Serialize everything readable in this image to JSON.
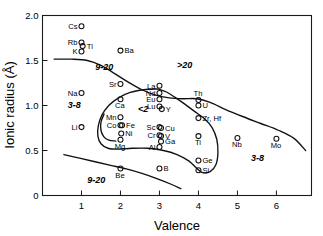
{
  "chart_data": {
    "type": "scatter",
    "title": "",
    "xlabel": "Valence",
    "ylabel": "Ionic radius (Å)",
    "xlim": [
      0,
      6.9
    ],
    "ylim": [
      0,
      2.0
    ],
    "xticks": [
      "1",
      "2",
      "3",
      "4",
      "5",
      "6"
    ],
    "xtick_values": [
      1,
      2,
      3,
      4,
      5,
      6
    ],
    "yticks": [
      "0",
      "0.5",
      "1.0",
      "1.5",
      "2.0"
    ],
    "ytick_values": [
      0,
      0.5,
      1.0,
      1.5,
      2.0
    ],
    "grid": false,
    "legend": "none",
    "points": [
      {
        "label": "Cs",
        "x": 1,
        "y": 1.88,
        "label_pos": "left"
      },
      {
        "label": "Rb",
        "x": 1,
        "y": 1.7,
        "label_pos": "left"
      },
      {
        "label": "Tl",
        "x": 1.03,
        "y": 1.66,
        "label_pos": "right"
      },
      {
        "label": "K",
        "x": 1,
        "y": 1.6,
        "label_pos": "left"
      },
      {
        "label": "Ba",
        "x": 2,
        "y": 1.61,
        "label_pos": "right"
      },
      {
        "label": "Sr",
        "x": 2,
        "y": 1.24,
        "label_pos": "left"
      },
      {
        "label": "La",
        "x": 3,
        "y": 1.22,
        "label_pos": "left"
      },
      {
        "label": "Na",
        "x": 1,
        "y": 1.14,
        "label_pos": "left"
      },
      {
        "label": "Nd",
        "x": 3,
        "y": 1.14,
        "label_pos": "left"
      },
      {
        "label": "Ca",
        "x": 2,
        "y": 1.07,
        "label_pos": "below"
      },
      {
        "label": "Eu",
        "x": 3,
        "y": 1.07,
        "label_pos": "left"
      },
      {
        "label": "Th",
        "x": 4,
        "y": 1.06,
        "label_pos": "above"
      },
      {
        "label": "U",
        "x": 4,
        "y": 1.0,
        "label_pos": "right"
      },
      {
        "label": "Lu",
        "x": 3,
        "y": 0.99,
        "label_pos": "left"
      },
      {
        "label": "Y",
        "x": 3.06,
        "y": 0.96,
        "label_pos": "right"
      },
      {
        "label": "Mn",
        "x": 2,
        "y": 0.87,
        "label_pos": "left"
      },
      {
        "label": "Zr, Hf",
        "x": 4,
        "y": 0.86,
        "label_pos": "right"
      },
      {
        "label": "Co",
        "x": 2,
        "y": 0.78,
        "label_pos": "left"
      },
      {
        "label": "Fe",
        "x": 2.04,
        "y": 0.78,
        "label_pos": "right"
      },
      {
        "label": "Li",
        "x": 1,
        "y": 0.76,
        "label_pos": "left"
      },
      {
        "label": "Sc",
        "x": 3,
        "y": 0.76,
        "label_pos": "left"
      },
      {
        "label": "Cu",
        "x": 3.04,
        "y": 0.75,
        "label_pos": "right"
      },
      {
        "label": "Ni",
        "x": 2.02,
        "y": 0.69,
        "label_pos": "right"
      },
      {
        "label": "Cr",
        "x": 3,
        "y": 0.67,
        "label_pos": "left"
      },
      {
        "label": "V",
        "x": 3.04,
        "y": 0.66,
        "label_pos": "right"
      },
      {
        "label": "Mg",
        "x": 2,
        "y": 0.62,
        "label_pos": "below"
      },
      {
        "label": "Ga",
        "x": 3.04,
        "y": 0.6,
        "label_pos": "right"
      },
      {
        "label": "Ti",
        "x": 4,
        "y": 0.66,
        "label_pos": "below"
      },
      {
        "label": "Nb",
        "x": 5,
        "y": 0.64,
        "label_pos": "below"
      },
      {
        "label": "Mo",
        "x": 6,
        "y": 0.63,
        "label_pos": "below"
      },
      {
        "label": "Al",
        "x": 3,
        "y": 0.54,
        "label_pos": "left"
      },
      {
        "label": "Ge",
        "x": 4,
        "y": 0.39,
        "label_pos": "right"
      },
      {
        "label": "B",
        "x": 3,
        "y": 0.3,
        "label_pos": "right"
      },
      {
        "label": "Be",
        "x": 2,
        "y": 0.3,
        "label_pos": "below"
      },
      {
        "label": "Si",
        "x": 4,
        "y": 0.28,
        "label_pos": "right"
      }
    ],
    "region_labels": [
      {
        "text": "9-20",
        "x": 1.35,
        "y": 1.4
      },
      {
        "text": ">20",
        "x": 3.45,
        "y": 1.42
      },
      {
        "text": "3-8",
        "x": 0.65,
        "y": 0.97
      },
      {
        "text": "<2",
        "x": 2.45,
        "y": 0.93
      },
      {
        "text": "3-8",
        "x": 5.35,
        "y": 0.38
      },
      {
        "text": "9-20",
        "x": 1.15,
        "y": 0.14
      }
    ],
    "field_boundaries": [
      {
        "name": "upper-boundary",
        "points": [
          [
            0.3,
            1.515
          ],
          [
            0.75,
            1.515
          ],
          [
            1.15,
            1.5
          ],
          [
            1.5,
            1.445
          ],
          [
            1.85,
            1.355
          ],
          [
            2.2,
            1.26
          ],
          [
            2.55,
            1.175
          ],
          [
            2.9,
            1.115
          ],
          [
            3.25,
            1.085
          ],
          [
            3.6,
            1.075
          ],
          [
            3.95,
            1.075
          ],
          [
            4.3,
            1.035
          ],
          [
            4.7,
            0.955
          ],
          [
            5.15,
            0.875
          ],
          [
            5.6,
            0.8
          ],
          [
            6.05,
            0.725
          ],
          [
            6.45,
            0.635
          ],
          [
            6.75,
            0.5
          ]
        ]
      },
      {
        "name": "inner-closed-field",
        "points": [
          [
            2.95,
            1.185
          ],
          [
            2.6,
            1.175
          ],
          [
            2.25,
            1.145
          ],
          [
            1.95,
            1.085
          ],
          [
            1.7,
            1.0
          ],
          [
            1.52,
            0.89
          ],
          [
            1.43,
            0.77
          ],
          [
            1.42,
            0.66
          ],
          [
            1.5,
            0.575
          ],
          [
            1.68,
            0.525
          ],
          [
            1.95,
            0.515
          ],
          [
            2.3,
            0.525
          ],
          [
            2.7,
            0.525
          ],
          [
            3.1,
            0.5
          ],
          [
            3.45,
            0.455
          ],
          [
            3.75,
            0.385
          ],
          [
            3.95,
            0.305
          ],
          [
            4.1,
            0.255
          ],
          [
            4.3,
            0.265
          ],
          [
            4.45,
            0.345
          ],
          [
            4.5,
            0.475
          ],
          [
            4.47,
            0.625
          ],
          [
            4.35,
            0.755
          ],
          [
            4.15,
            0.855
          ],
          [
            3.9,
            0.935
          ],
          [
            3.65,
            1.015
          ],
          [
            3.4,
            1.09
          ],
          [
            3.18,
            1.15
          ],
          [
            2.95,
            1.185
          ]
        ]
      },
      {
        "name": "lower-boundary",
        "points": [
          [
            0.55,
            0.455
          ],
          [
            0.95,
            0.415
          ],
          [
            1.35,
            0.375
          ],
          [
            1.75,
            0.335
          ],
          [
            2.15,
            0.295
          ],
          [
            2.55,
            0.245
          ],
          [
            2.95,
            0.185
          ],
          [
            3.3,
            0.125
          ],
          [
            3.55,
            0.075
          ]
        ]
      },
      {
        "name": "inner-left-arc",
        "points": [
          [
            1.58,
            0.905
          ],
          [
            1.5,
            0.815
          ],
          [
            1.5,
            0.725
          ],
          [
            1.57,
            0.655
          ],
          [
            1.7,
            0.615
          ],
          [
            1.88,
            0.605
          ]
        ]
      }
    ]
  }
}
